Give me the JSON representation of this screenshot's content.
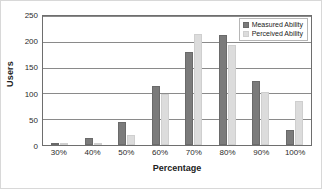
{
  "chart_data": {
    "type": "bar",
    "title": "",
    "xlabel": "Percentage",
    "ylabel": "Users",
    "categories": [
      "30%",
      "40%",
      "50%",
      "60%",
      "70%",
      "80%",
      "90%",
      "100%"
    ],
    "series": [
      {
        "name": "Measured Ability",
        "color": "#7b7b7b",
        "values": [
          2,
          14,
          45,
          115,
          180,
          214,
          124,
          30
        ]
      },
      {
        "name": "Perceived Ability",
        "color": "#dcdcdc",
        "values": [
          1,
          1,
          19,
          98,
          216,
          194,
          103,
          85
        ]
      }
    ],
    "ylim": [
      0,
      250
    ],
    "yticks": [
      0,
      50,
      100,
      150,
      200,
      250
    ],
    "grid": true,
    "legend_position": "top-right"
  }
}
